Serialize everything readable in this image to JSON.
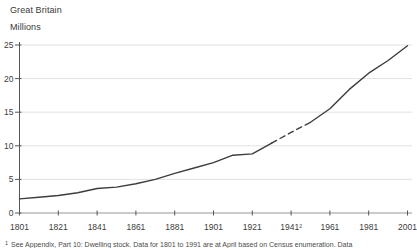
{
  "header": {
    "region": "Great Britain",
    "units": "Millions"
  },
  "footnote": {
    "marker": "1",
    "text": "See Appendix, Part 10: Dwelling stock. Data for 1801 to 1991 are at April based on Census enumeration. Data"
  },
  "colors": {
    "line": "#3d3d3d",
    "grid": "#e2e2e2",
    "y_axis": "#555555",
    "x_axis": "#969696",
    "tick": "#555555",
    "label_text": "#3c3c3c"
  },
  "chart_data": {
    "type": "line",
    "title": "",
    "coverage_label": "Great Britain",
    "unit_label": "Millions",
    "x": [
      1801,
      1811,
      1821,
      1831,
      1841,
      1851,
      1861,
      1871,
      1881,
      1891,
      1901,
      1911,
      1921,
      1931,
      1941,
      1951,
      1961,
      1971,
      1981,
      1991,
      2001
    ],
    "values": [
      2.1,
      2.35,
      2.6,
      3.0,
      3.65,
      3.85,
      4.35,
      5.0,
      5.9,
      6.7,
      7.5,
      8.6,
      8.8,
      10.4,
      12.0,
      13.5,
      15.5,
      18.4,
      20.8,
      22.7,
      24.9
    ],
    "series_name": "Dwelling stock (millions)",
    "dashed_x_range": [
      1931,
      1951
    ],
    "dashed_reason_tick": "1941",
    "xlim": [
      1801,
      2001
    ],
    "ylim": [
      0,
      25
    ],
    "xticks": [
      1801,
      1821,
      1841,
      1861,
      1881,
      1901,
      1921,
      1941,
      1961,
      1981,
      2001
    ],
    "xtick_labels": [
      "1801",
      "1821",
      "1841",
      "1861",
      "1881",
      "1901",
      "1921",
      "1941²",
      "1961",
      "1981",
      "2001"
    ],
    "yticks": [
      0,
      5,
      10,
      15,
      20,
      25
    ],
    "ytick_labels": [
      "0",
      "5",
      "10",
      "15",
      "20",
      "25"
    ],
    "grid": "horizontal",
    "legend": "none"
  }
}
